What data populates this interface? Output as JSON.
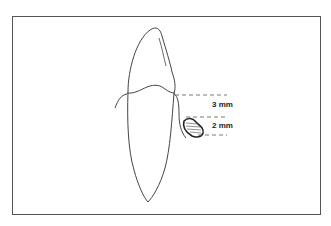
{
  "diagram": {
    "labels": {
      "upper_measurement": "3 mm",
      "lower_measurement": "2 mm"
    },
    "colors": {
      "line": "#444444",
      "frame": "#555555",
      "background": "#ffffff"
    }
  }
}
